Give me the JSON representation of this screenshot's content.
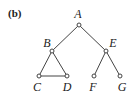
{
  "panel_label": "(b)",
  "graph": {
    "nodes": [
      {
        "id": "A",
        "label": "A",
        "x": 79,
        "y": 25,
        "lx": 78,
        "ly": 18
      },
      {
        "id": "B",
        "label": "B",
        "x": 52,
        "y": 51,
        "lx": 47,
        "ly": 47
      },
      {
        "id": "E",
        "label": "E",
        "x": 106,
        "y": 51,
        "lx": 113,
        "ly": 47
      },
      {
        "id": "C",
        "label": "C",
        "x": 39,
        "y": 76,
        "lx": 37,
        "ly": 91
      },
      {
        "id": "D",
        "label": "D",
        "x": 67,
        "y": 76,
        "lx": 67,
        "ly": 91
      },
      {
        "id": "F",
        "label": "F",
        "x": 94,
        "y": 76,
        "lx": 93,
        "ly": 91
      },
      {
        "id": "G",
        "label": "G",
        "x": 120,
        "y": 76,
        "lx": 122,
        "ly": 91
      }
    ],
    "edges": [
      [
        "A",
        "B"
      ],
      [
        "A",
        "E"
      ],
      [
        "B",
        "C"
      ],
      [
        "B",
        "D"
      ],
      [
        "C",
        "D"
      ],
      [
        "E",
        "F"
      ],
      [
        "E",
        "G"
      ]
    ]
  }
}
